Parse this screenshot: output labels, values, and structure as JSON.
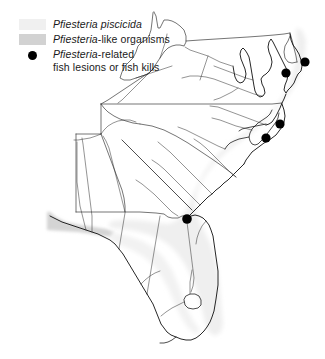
{
  "figure": {
    "name": "pfiesteria-distribution-map",
    "background_color": "#ffffff"
  },
  "legend": {
    "items": [
      {
        "key": "pfiesteria-piscicida",
        "swatch_type": "area-swatch",
        "swatch_color": "#f0f0f0",
        "italic_text": "Pfiesteria piscicida",
        "roman_text": "",
        "line2": ""
      },
      {
        "key": "pfiesteria-like-organisms",
        "swatch_type": "area-swatch",
        "swatch_color": "#d2d2d2",
        "italic_text": "Pfiesteria",
        "roman_text": "-like organisms",
        "line2": ""
      },
      {
        "key": "pfiesteria-related-fish-lesions-or-fish-kills",
        "swatch_type": "point-marker",
        "swatch_color": "#000000",
        "italic_text": "Pfiesteria",
        "roman_text": "-related",
        "line2": "fish lesions or fish kills"
      }
    ]
  },
  "map": {
    "region_name": "U.S. Mid-Atlantic and Southeast Coast",
    "coastline_color": "#000000",
    "state_border_color": "#555555",
    "river_color": "#222222",
    "piscicida_band_color": "#f0f0f0",
    "like_organisms_band_color": "#d2d2d2",
    "land_fill": "#ffffff"
  },
  "chart_data": {
    "type": "scatter",
    "title": "",
    "xlabel": "",
    "ylabel": "",
    "projection": "map",
    "marker_label": "Pfiesteria-related fish lesions or fish kills",
    "points": [
      {
        "id": "chesapeake-upper-delmarva",
        "x": 305,
        "y": 62,
        "r": 4.6
      },
      {
        "id": "chesapeake-lower-bay",
        "x": 286,
        "y": 73,
        "r": 4.6
      },
      {
        "id": "north-carolina-pamlico",
        "x": 280,
        "y": 124,
        "r": 4.6
      },
      {
        "id": "north-carolina-neuse",
        "x": 266,
        "y": 138,
        "r": 4.6
      },
      {
        "id": "northeast-florida",
        "x": 187,
        "y": 219,
        "r": 4.8
      }
    ],
    "shaded_bands": [
      {
        "id": "atlantic-coastal-piscicida-band",
        "color": "#f0f0f0"
      },
      {
        "id": "gulf-panhandle-like-organisms-band",
        "color": "#d2d2d2"
      }
    ]
  }
}
